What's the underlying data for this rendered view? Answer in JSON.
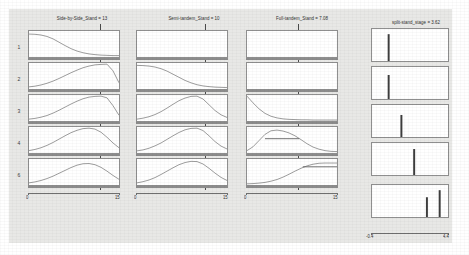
{
  "figure": {
    "background_color": "#e8e8e6",
    "panel_color": "#ffffff",
    "line_color": "#8c8c8c",
    "reference_line_color": "#4a4a4a",
    "columns": [
      {
        "title": "Side-by-Side_Stand = 13"
      },
      {
        "title": "Semi-tandem_Stand = 10"
      },
      {
        "title": "Full-tandem_Stand = 7.08"
      },
      {
        "title": "split-stand_stage = 3.62"
      }
    ],
    "row_labels": [
      "1",
      "2",
      "3",
      "4",
      "6"
    ],
    "x_axis_left": {
      "ticks": [
        "0",
        "15"
      ],
      "min": 0,
      "max": 15
    },
    "x_axis_right": {
      "ticks": [
        "-0.4",
        "4.4"
      ],
      "min": -0.4,
      "max": 4.4
    }
  },
  "chart_data": {
    "type": "line",
    "title": "",
    "xlabel": "",
    "ylabel": "",
    "legend": [],
    "grid": false,
    "columns": [
      {
        "name": "Side-by-Side_Stand = 13",
        "cut_value": 13,
        "xlim": [
          0,
          15
        ],
        "ylim": [
          0,
          1
        ],
        "panels": [
          {
            "row": "1",
            "curve": "descending-sigmoid",
            "peak_x": 0.0,
            "peak_y": 0.92,
            "values": [
              0.92,
              0.91,
              0.88,
              0.82,
              0.72,
              0.58,
              0.44,
              0.31,
              0.21,
              0.14,
              0.09,
              0.06,
              0.04,
              0.03,
              0.02,
              0.02
            ]
          },
          {
            "row": "2",
            "curve": "bell-peak-at-cut",
            "peak_x": 13,
            "peak_y": 1.0,
            "values": [
              0.05,
              0.08,
              0.13,
              0.2,
              0.29,
              0.4,
              0.52,
              0.64,
              0.75,
              0.85,
              0.92,
              0.97,
              0.99,
              1.0,
              0.72,
              0.22
            ]
          },
          {
            "row": "3",
            "curve": "bell-peak-at-cut",
            "peak_x": 12,
            "peak_y": 1.0,
            "values": [
              0.04,
              0.07,
              0.12,
              0.19,
              0.29,
              0.41,
              0.54,
              0.67,
              0.79,
              0.89,
              0.96,
              0.99,
              1.0,
              0.93,
              0.6,
              0.2
            ]
          },
          {
            "row": "4",
            "curve": "bell-peak-at-cut",
            "peak_x": 11,
            "peak_y": 1.0,
            "values": [
              0.06,
              0.11,
              0.18,
              0.28,
              0.4,
              0.54,
              0.68,
              0.81,
              0.91,
              0.98,
              1.0,
              0.96,
              0.83,
              0.62,
              0.38,
              0.18
            ]
          },
          {
            "row": "6",
            "curve": "bell-peak-at-cut",
            "peak_x": 10.5,
            "peak_y": 0.86,
            "values": [
              0.05,
              0.09,
              0.15,
              0.23,
              0.33,
              0.45,
              0.57,
              0.69,
              0.79,
              0.85,
              0.86,
              0.81,
              0.7,
              0.54,
              0.36,
              0.2
            ]
          }
        ]
      },
      {
        "name": "Semi-tandem_Stand = 10",
        "cut_value": 10,
        "xlim": [
          0,
          15
        ],
        "ylim": [
          0,
          1
        ],
        "panels": [
          {
            "row": "1",
            "curve": "flat-zero",
            "peak_x": 0,
            "peak_y": 0.0,
            "values": [
              0,
              0,
              0,
              0,
              0,
              0,
              0,
              0,
              0,
              0,
              0,
              0,
              0,
              0,
              0,
              0
            ]
          },
          {
            "row": "2",
            "curve": "descending-sigmoid",
            "peak_x": 0.0,
            "peak_y": 0.95,
            "values": [
              0.95,
              0.94,
              0.92,
              0.88,
              0.81,
              0.71,
              0.58,
              0.45,
              0.32,
              0.22,
              0.14,
              0.09,
              0.06,
              0.04,
              0.03,
              0.02
            ]
          },
          {
            "row": "3",
            "curve": "bell-peak-at-cut",
            "peak_x": 10,
            "peak_y": 1.0,
            "values": [
              0.04,
              0.08,
              0.14,
              0.23,
              0.35,
              0.5,
              0.66,
              0.81,
              0.92,
              0.99,
              1.0,
              0.88,
              0.64,
              0.4,
              0.22,
              0.11
            ]
          },
          {
            "row": "4",
            "curve": "bell-peak-at-cut",
            "peak_x": 10,
            "peak_y": 1.0,
            "values": [
              0.05,
              0.09,
              0.16,
              0.26,
              0.38,
              0.53,
              0.68,
              0.82,
              0.93,
              0.99,
              1.0,
              0.9,
              0.68,
              0.44,
              0.25,
              0.13
            ]
          },
          {
            "row": "6",
            "curve": "bell-peak-at-cut",
            "peak_x": 10,
            "peak_y": 0.95,
            "values": [
              0.05,
              0.1,
              0.17,
              0.27,
              0.4,
              0.54,
              0.68,
              0.81,
              0.9,
              0.95,
              0.94,
              0.84,
              0.66,
              0.46,
              0.28,
              0.15
            ]
          }
        ]
      },
      {
        "name": "Full-tandem_Stand = 7.08",
        "cut_value": 7.08,
        "xlim": [
          0,
          15
        ],
        "ylim": [
          0,
          1
        ],
        "panels": [
          {
            "row": "1",
            "curve": "flat-zero",
            "peak_x": 0,
            "peak_y": 0.0,
            "values": [
              0,
              0,
              0,
              0,
              0,
              0,
              0,
              0,
              0,
              0,
              0,
              0,
              0,
              0,
              0,
              0
            ]
          },
          {
            "row": "2",
            "curve": "flat-zero",
            "peak_x": 0,
            "peak_y": 0.0,
            "values": [
              0,
              0,
              0,
              0,
              0,
              0,
              0,
              0,
              0,
              0,
              0,
              0,
              0,
              0,
              0,
              0
            ]
          },
          {
            "row": "3",
            "curve": "steep-decay",
            "peak_x": 0.0,
            "peak_y": 1.0,
            "values": [
              1.0,
              0.72,
              0.47,
              0.28,
              0.16,
              0.09,
              0.05,
              0.03,
              0.02,
              0.01,
              0.01,
              0.0,
              0.0,
              0.0,
              0.0,
              0.0
            ]
          },
          {
            "row": "4",
            "curve": "bell-with-plateau",
            "peak_x": 4.5,
            "peak_y": 0.92,
            "values": [
              0.06,
              0.22,
              0.48,
              0.74,
              0.89,
              0.92,
              0.88,
              0.8,
              0.68,
              0.52,
              0.35,
              0.21,
              0.12,
              0.06,
              0.03,
              0.02
            ]
          },
          {
            "row": "6",
            "curve": "ascending-sigmoid",
            "peak_x": 15,
            "peak_y": 0.88,
            "values": [
              0.01,
              0.02,
              0.04,
              0.07,
              0.12,
              0.19,
              0.29,
              0.41,
              0.54,
              0.66,
              0.76,
              0.83,
              0.87,
              0.88,
              0.88,
              0.88
            ]
          }
        ]
      },
      {
        "name": "split-stand_stage = 3.62",
        "cut_value": 3.62,
        "xlim": [
          -0.4,
          4.4
        ],
        "ylim": [
          0,
          1
        ],
        "panels": [
          {
            "row": "1",
            "curve": "spike",
            "peak_x": 1.0,
            "peak_y": 0.95,
            "values": [
              0,
              0,
              0.95,
              0,
              0,
              0,
              0,
              0,
              0,
              0,
              0,
              0
            ]
          },
          {
            "row": "2",
            "curve": "spike",
            "peak_x": 1.0,
            "peak_y": 0.85,
            "values": [
              0,
              0,
              0.85,
              0,
              0,
              0,
              0,
              0,
              0,
              0,
              0,
              0
            ]
          },
          {
            "row": "3",
            "curve": "spike",
            "peak_x": 2.0,
            "peak_y": 0.78,
            "values": [
              0,
              0,
              0,
              0,
              0.78,
              0,
              0,
              0,
              0,
              0,
              0,
              0
            ]
          },
          {
            "row": "4",
            "curve": "spike",
            "peak_x": 3.0,
            "peak_y": 0.92,
            "values": [
              0,
              0,
              0,
              0,
              0,
              0,
              0.92,
              0,
              0,
              0,
              0,
              0
            ]
          },
          {
            "row": "6",
            "curve": "double-spike",
            "peak_x": 3.8,
            "peak_y": 0.95,
            "values": [
              0,
              0,
              0,
              0,
              0,
              0,
              0,
              0,
              0.7,
              0,
              0.95,
              0
            ]
          }
        ]
      }
    ]
  }
}
